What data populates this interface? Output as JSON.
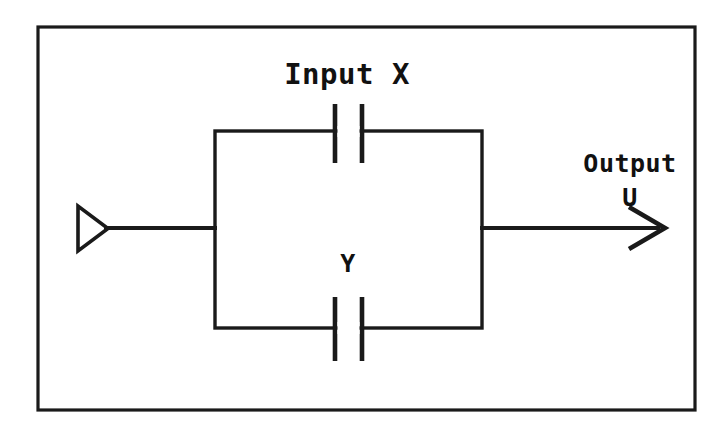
{
  "figure": {
    "kind": "circuit-diagram",
    "width": 724,
    "height": 435,
    "background_color": "#ffffff",
    "ink_color": "#1a1a1a"
  },
  "labels": {
    "input": "Input X",
    "branch_lower": "Y",
    "output": "Output",
    "output_symbol": "U"
  },
  "components": [
    {
      "name": "source-terminal",
      "type": "open-triangle",
      "label": ""
    },
    {
      "name": "contact-x",
      "type": "capacitor-contact",
      "label": "Input X",
      "branch": "upper"
    },
    {
      "name": "contact-y",
      "type": "capacitor-contact",
      "label": "Y",
      "branch": "lower"
    },
    {
      "name": "output-arrow",
      "type": "open-arrowhead",
      "label": "Output U"
    }
  ],
  "geometry": {
    "outer_frame": {
      "x": 38,
      "y": 27,
      "width": 657,
      "height": 383
    },
    "loop_rect": {
      "x": 215,
      "y": 131,
      "width": 267,
      "height": 197
    },
    "mid_y": 228,
    "source_triangle": {
      "left": 76,
      "tip_x": 108,
      "top_y": 205,
      "bottom_y": 252
    },
    "input_lead": {
      "x1": 108,
      "x2": 215,
      "y": 228
    },
    "output_lead": {
      "x1": 482,
      "x2": 662,
      "y": 228
    },
    "arrow_tip": {
      "x": 662,
      "y": 228
    },
    "upper_contact": {
      "left_plate_x": 334,
      "right_plate_x": 361,
      "top_y": 104,
      "bottom_y": 162
    },
    "lower_contact": {
      "left_plate_x": 334,
      "right_plate_x": 361,
      "top_y": 297,
      "bottom_y": 360
    }
  },
  "text_positions": {
    "input_x": {
      "x": 347,
      "y": 84
    },
    "output": {
      "x": 630,
      "y": 172
    },
    "output_u": {
      "x": 630,
      "y": 205
    },
    "y": {
      "x": 348,
      "y": 272
    }
  }
}
